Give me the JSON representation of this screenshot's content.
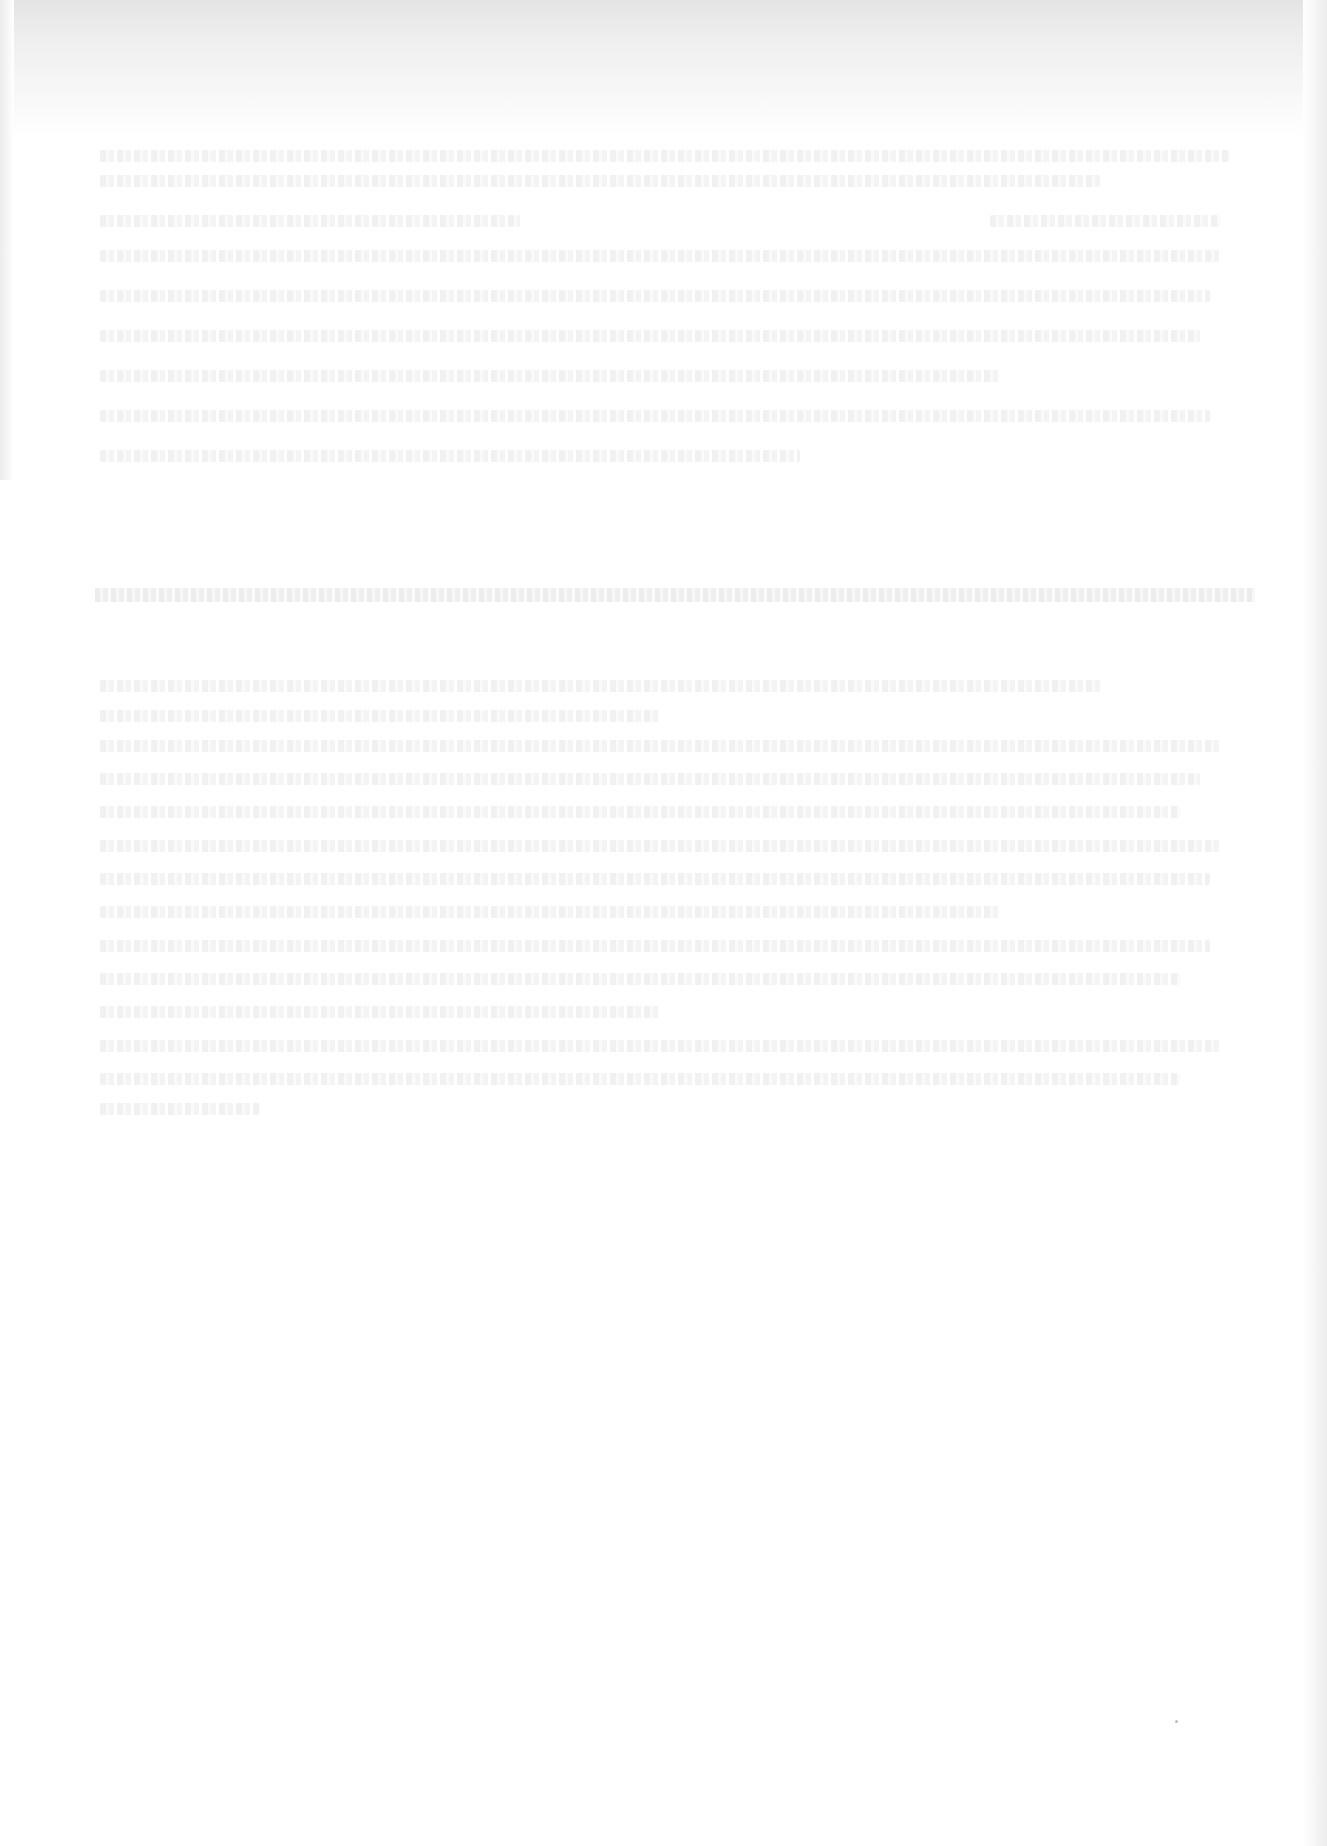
{
  "document": {
    "type": "scanned-page",
    "legibility": "illegible",
    "background": "#ffffff",
    "scan_shading": "#e4e4e4",
    "text_lines": [
      {
        "top": 150,
        "left": 100,
        "width": 1130
      },
      {
        "top": 175,
        "left": 100,
        "width": 1000
      },
      {
        "top": 215,
        "left": 100,
        "width": 420
      },
      {
        "top": 215,
        "left": 990,
        "width": 230
      },
      {
        "top": 250,
        "left": 100,
        "width": 1120
      },
      {
        "top": 290,
        "left": 100,
        "width": 1110
      },
      {
        "top": 330,
        "left": 100,
        "width": 1100
      },
      {
        "top": 370,
        "left": 100,
        "width": 900
      },
      {
        "top": 410,
        "left": 100,
        "width": 1110
      },
      {
        "top": 450,
        "left": 100,
        "width": 700
      }
    ],
    "band": {
      "top": 588,
      "left": 95,
      "width": 1160
    },
    "list_lines": [
      {
        "top": 680,
        "left": 100,
        "width": 1000
      },
      {
        "top": 710,
        "left": 100,
        "width": 560
      },
      {
        "top": 740,
        "left": 100,
        "width": 1120
      },
      {
        "top": 773,
        "left": 100,
        "width": 1100
      },
      {
        "top": 806,
        "left": 100,
        "width": 1080
      },
      {
        "top": 840,
        "left": 100,
        "width": 1120
      },
      {
        "top": 873,
        "left": 100,
        "width": 1110
      },
      {
        "top": 906,
        "left": 100,
        "width": 900
      },
      {
        "top": 940,
        "left": 100,
        "width": 1110
      },
      {
        "top": 973,
        "left": 100,
        "width": 1080
      },
      {
        "top": 1006,
        "left": 100,
        "width": 560
      },
      {
        "top": 1040,
        "left": 100,
        "width": 1120
      },
      {
        "top": 1073,
        "left": 100,
        "width": 1080
      },
      {
        "top": 1103,
        "left": 100,
        "width": 160
      }
    ],
    "marks": [
      {
        "top": 1720,
        "left": 1175
      }
    ]
  }
}
